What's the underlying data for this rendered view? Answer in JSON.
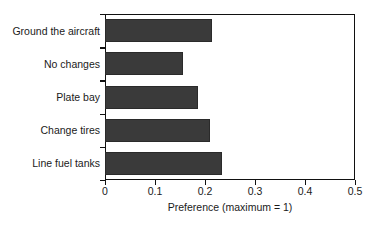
{
  "chart_data": {
    "type": "bar",
    "orientation": "horizontal",
    "title": "",
    "xlabel": "Preference (maximum = 1)",
    "ylabel": "",
    "categories": [
      "Ground the aircraft",
      "No changes",
      "Plate bay",
      "Change tires",
      "Line fuel tanks"
    ],
    "values": [
      0.214,
      0.156,
      0.185,
      0.21,
      0.234
    ],
    "xlim": [
      0,
      0.5
    ],
    "xticks": [
      0,
      0.1,
      0.2,
      0.3,
      0.4,
      0.5
    ],
    "xtick_labels": [
      "0",
      "0.1",
      "0.2",
      "0.3",
      "0.4",
      "0.5"
    ],
    "grid": false,
    "legend": false,
    "bar_color": "#3a3a3a",
    "axis_color": "#111111",
    "background_color": "#ffffff"
  }
}
